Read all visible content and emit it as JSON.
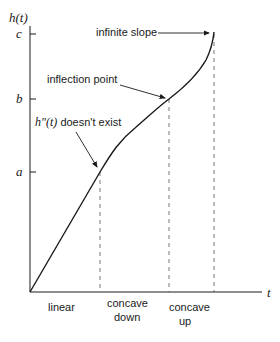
{
  "diagram": {
    "y_axis_label": "h(t)",
    "x_axis_label": "t",
    "y_ticks": [
      {
        "label": "c",
        "y": 34
      },
      {
        "label": "b",
        "y": 99
      },
      {
        "label": "a",
        "y": 172
      }
    ],
    "annotations": {
      "infinite_slope": "infinite slope",
      "inflection_point": "inflection point",
      "h_double_prime_prefix": "h″(t)",
      "h_double_prime_suffix": " doesn't exist"
    },
    "regions": [
      {
        "line1": "linear",
        "line2": ""
      },
      {
        "line1": "concave",
        "line2": "down"
      },
      {
        "line1": "concave",
        "line2": "up"
      }
    ],
    "colors": {
      "line": "#1a1a1a",
      "dashed": "#555555",
      "background": "#ffffff"
    }
  }
}
